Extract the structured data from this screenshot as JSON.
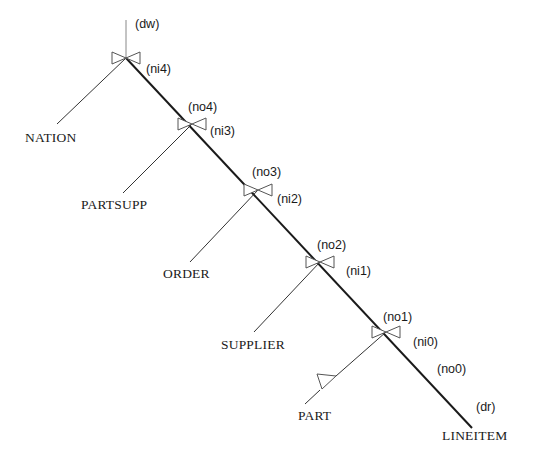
{
  "diagram": {
    "type": "left-deep join tree",
    "root_label": "(dw)",
    "leaf_label": "(dr)",
    "tables": [
      "NATION",
      "PARTSUPP",
      "ORDER",
      "SUPPLIER",
      "PART",
      "LINEITEM"
    ],
    "joins": [
      {
        "input_label": "(ni4)",
        "output_label": "(dw)",
        "table": "NATION"
      },
      {
        "input_label": "(ni3)",
        "output_label": "(no4)",
        "table": "PARTSUPP"
      },
      {
        "input_label": "(ni2)",
        "output_label": "(no3)",
        "table": "ORDER"
      },
      {
        "input_label": "(ni1)",
        "output_label": "(no2)",
        "table": "SUPPLIER"
      },
      {
        "input_label": "(ni0)",
        "output_label": "(no1)",
        "table": "PART"
      }
    ],
    "labels": {
      "dw": "(dw)",
      "ni4": "(ni4)",
      "no4": "(no4)",
      "ni3": "(ni3)",
      "no3": "(no3)",
      "ni2": "(ni2)",
      "no2": "(no2)",
      "ni1": "(ni1)",
      "no1": "(no1)",
      "ni0": "(ni0)",
      "no0": "(no0)",
      "dr": "(dr)"
    },
    "table_labels": {
      "nation": "NATION",
      "partsupp": "PARTSUPP",
      "order": "ORDER",
      "supplier": "SUPPLIER",
      "part": "PART",
      "lineitem": "LINEITEM"
    },
    "colors": {
      "line": "#1a1a1a",
      "thin_line": "#333333",
      "bowtie": "#555555"
    }
  }
}
